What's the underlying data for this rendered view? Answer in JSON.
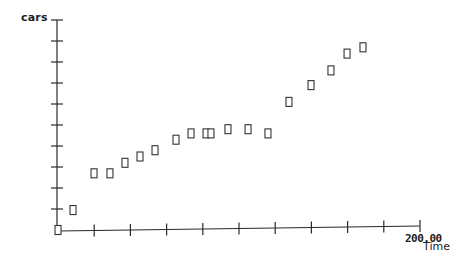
{
  "chart_data": {
    "type": "scatter",
    "title": "",
    "xlabel": "Time",
    "ylabel": "cars",
    "x_max_label": "200.00",
    "xlim": [
      0,
      200
    ],
    "ylim_ticks": [
      0,
      10
    ],
    "x_tick_step": 20,
    "y_tick_count": 10,
    "grid": false,
    "legend": null,
    "marker": "open-square",
    "series": [
      {
        "name": "cars",
        "points": [
          {
            "x": 0,
            "y": 0
          },
          {
            "x": 8.3,
            "y": 0.95
          },
          {
            "x": 19.9,
            "y": 2.7
          },
          {
            "x": 28.7,
            "y": 2.7
          },
          {
            "x": 37.0,
            "y": 3.2
          },
          {
            "x": 45.3,
            "y": 3.5
          },
          {
            "x": 53.6,
            "y": 3.8
          },
          {
            "x": 65.2,
            "y": 4.3
          },
          {
            "x": 73.5,
            "y": 4.6
          },
          {
            "x": 81.8,
            "y": 4.6
          },
          {
            "x": 84.5,
            "y": 4.6
          },
          {
            "x": 93.9,
            "y": 4.8
          },
          {
            "x": 105.0,
            "y": 4.8
          },
          {
            "x": 116.0,
            "y": 4.6
          },
          {
            "x": 127.6,
            "y": 6.1
          },
          {
            "x": 139.8,
            "y": 6.9
          },
          {
            "x": 150.8,
            "y": 7.6
          },
          {
            "x": 159.7,
            "y": 8.4
          },
          {
            "x": 168.5,
            "y": 8.7
          }
        ]
      }
    ]
  },
  "colors": {
    "axis": "#2a2a2a",
    "marker_stroke": "#333333",
    "background": "#ffffff"
  }
}
